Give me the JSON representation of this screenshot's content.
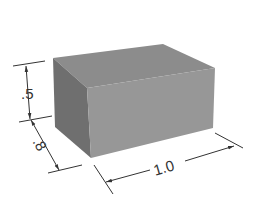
{
  "diagram": {
    "type": "isometric-box-with-dimensions",
    "dimensions": {
      "height": ".5",
      "depth": ".8",
      "width": "1.0"
    },
    "colors": {
      "top_face": "#8a8a8a",
      "left_face": "#6e6e6e",
      "front_face": "#959595",
      "dimension_lines": "#333333"
    }
  }
}
